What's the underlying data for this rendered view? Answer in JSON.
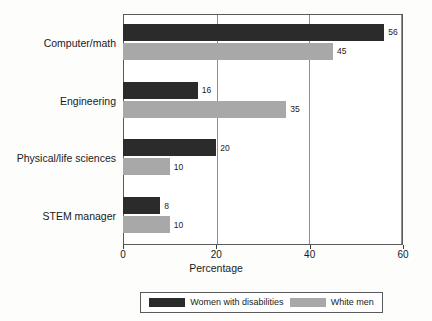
{
  "chart_data": {
    "type": "bar",
    "orientation": "horizontal",
    "title": "",
    "xlabel": "Percentage",
    "ylabel": "",
    "xlim": [
      0,
      60
    ],
    "xticks": [
      0,
      20,
      40,
      60
    ],
    "xtick_labels": [
      "0",
      "20",
      "40",
      "60"
    ],
    "grid": "vertical",
    "legend_position": "bottom",
    "categories": [
      "Computer/math",
      "Engineering",
      "Physical/life sciences",
      "STEM manager"
    ],
    "series": [
      {
        "name": "Women with disabilities",
        "color": "#2b2b2b",
        "values": [
          56,
          16,
          20,
          8
        ],
        "value_labels": [
          "56",
          "16",
          "20",
          "8"
        ]
      },
      {
        "name": "White men",
        "color": "#a8a8a8",
        "values": [
          45,
          35,
          10,
          10
        ],
        "value_labels": [
          "45",
          "35",
          "10",
          "10"
        ]
      }
    ]
  }
}
